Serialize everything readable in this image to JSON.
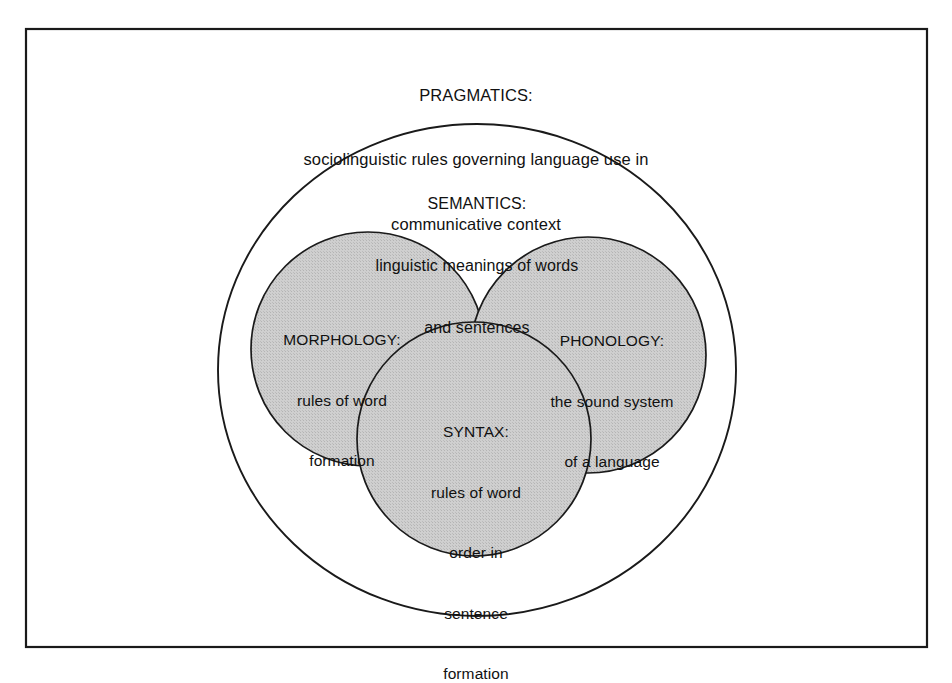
{
  "figure": {
    "type": "venn-nested-diagram",
    "frame": {
      "name": "outer-rectangle-border",
      "stroke": "#1a1a1a"
    },
    "background_color": "#ffffff",
    "shaded_fill": "#c8c8c8",
    "stroke_color": "#1a1a1a"
  },
  "regions": {
    "pragmatics": {
      "name": "PRAGMATICS",
      "title": "PRAGMATICS:",
      "line1": "sociolinguistic rules governing language use in",
      "line2": "communicative context",
      "shape": "rectangle-frame",
      "shaded": false
    },
    "semantics": {
      "name": "SEMANTICS",
      "title": "SEMANTICS:",
      "line1": "linguistic meanings of words",
      "line2": "and sentences",
      "shape": "ellipse",
      "shaded": false
    },
    "morphology": {
      "name": "MORPHOLOGY",
      "title": "MORPHOLOGY:",
      "line1": "rules of word",
      "line2": "formation",
      "shape": "circle",
      "shaded": true
    },
    "phonology": {
      "name": "PHONOLOGY",
      "title": "PHONOLOGY:",
      "line1": "the sound system",
      "line2": "of a language",
      "shape": "circle",
      "shaded": true
    },
    "syntax": {
      "name": "SYNTAX",
      "title": "SYNTAX:",
      "line1": "rules of word",
      "line2": "order in",
      "line3": "sentence",
      "line4": "formation",
      "shape": "circle",
      "shaded": true
    }
  }
}
